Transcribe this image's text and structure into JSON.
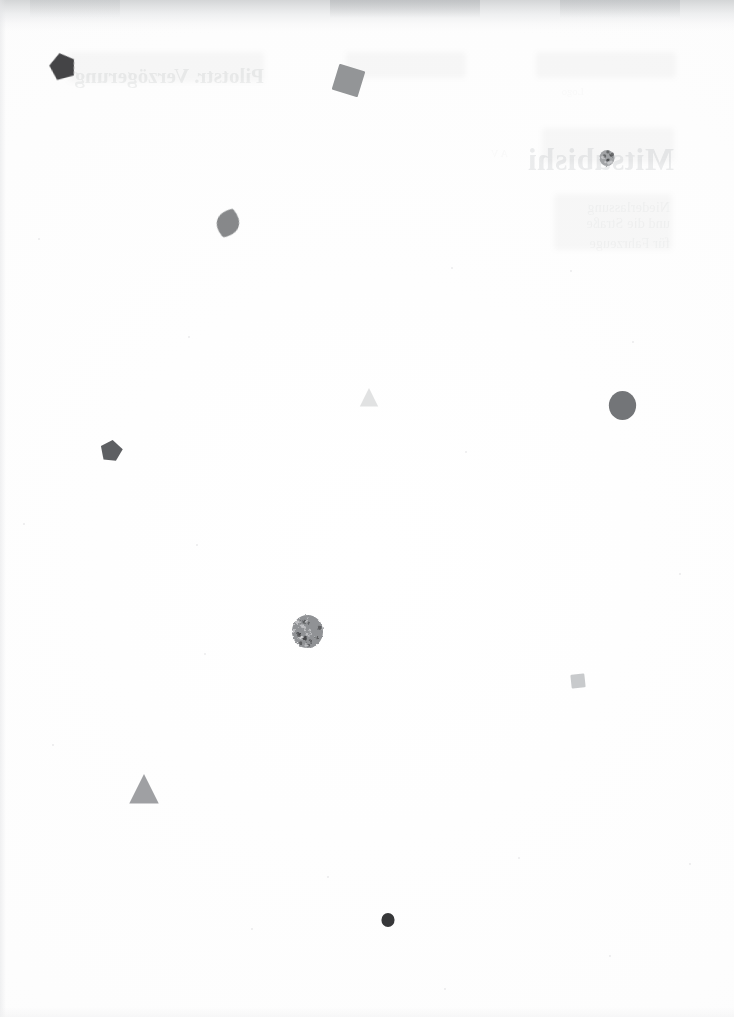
{
  "page": {
    "kind": "scanned-paper-page",
    "width_px": 734,
    "height_px": 1017,
    "paper_color": "#ffffff",
    "scanner_edge_color": "#c4c6c8",
    "caption": ""
  },
  "bleed_through": {
    "note": "Show-through text from the reverse side of the sheet; appears mirrored and extremely faint.",
    "lines": [
      {
        "id": "bt-title-right",
        "text": "Pilotstr. Verzögerung",
        "style": "subhead",
        "x": 470,
        "y": 64,
        "opacity": 0.1
      },
      {
        "id": "bt-title-left",
        "text": "Mitsubishi",
        "style": "headline",
        "x": 60,
        "y": 142,
        "opacity": 0.11
      },
      {
        "id": "bt-line-1",
        "text": "Niederlassung",
        "style": "body",
        "x": 64,
        "y": 200,
        "opacity": 0.07
      },
      {
        "id": "bt-line-2",
        "text": "und die Straße",
        "style": "body",
        "x": 64,
        "y": 216,
        "opacity": 0.07
      },
      {
        "id": "bt-line-3",
        "text": "für Fahrzeuge",
        "style": "body",
        "x": 64,
        "y": 236,
        "opacity": 0.07
      },
      {
        "id": "bt-line-4",
        "text": "A V",
        "style": "tiny",
        "x": 226,
        "y": 148,
        "opacity": 0.06
      },
      {
        "id": "bt-line-5",
        "text": "Logo",
        "style": "tiny",
        "x": 150,
        "y": 86,
        "opacity": 0.05
      }
    ],
    "blocks": [
      {
        "id": "bt-block-1",
        "x": 58,
        "y": 52,
        "w": 140,
        "h": 26
      },
      {
        "id": "bt-block-2",
        "x": 268,
        "y": 52,
        "w": 120,
        "h": 26
      },
      {
        "id": "bt-block-3",
        "x": 470,
        "y": 52,
        "w": 196,
        "h": 30
      },
      {
        "id": "bt-block-4",
        "x": 60,
        "y": 128,
        "w": 132,
        "h": 34
      },
      {
        "id": "bt-block-5",
        "x": 62,
        "y": 194,
        "w": 118,
        "h": 56
      }
    ]
  },
  "marks": [
    {
      "id": "mark-pentagon-dark",
      "shape": "pentagon",
      "label": "dark charcoal pentagon particle",
      "cx": 63,
      "cy": 67,
      "size": 28,
      "rotation": -12,
      "fill": "#3b3b3d",
      "opacity": 0.95,
      "texture": "rough"
    },
    {
      "id": "mark-square-gray-top",
      "shape": "square",
      "label": "mid-gray rotated square particle",
      "cx": 348,
      "cy": 80,
      "size": 27,
      "rotation": 17,
      "fill": "#8e9092",
      "opacity": 0.95,
      "texture": "flat"
    },
    {
      "id": "mark-circle-small-right",
      "shape": "circle",
      "label": "small mottled gray circle",
      "cx": 607,
      "cy": 158,
      "size": 16,
      "rotation": 0,
      "fill": "#9b9da0",
      "opacity": 0.92,
      "texture": "mottled"
    },
    {
      "id": "mark-lens-gray",
      "shape": "lens",
      "label": "gray lens / leaf shaped particle",
      "cx": 228,
      "cy": 223,
      "size": 30,
      "rotation": 18,
      "fill": "#7e8082",
      "opacity": 0.93,
      "texture": "rough"
    },
    {
      "id": "mark-triangle-faint",
      "shape": "triangle",
      "label": "very faint light-gray triangle",
      "cx": 369,
      "cy": 398,
      "size": 20,
      "rotation": 0,
      "fill": "#dedfe0",
      "opacity": 0.9,
      "texture": "flat"
    },
    {
      "id": "mark-circle-big-right",
      "shape": "circle",
      "label": "large solid gray circle",
      "cx": 622,
      "cy": 405,
      "size": 29,
      "rotation": 0,
      "fill": "#6e7073",
      "opacity": 0.96,
      "texture": "flat"
    },
    {
      "id": "mark-pentagon-mid",
      "shape": "pentagon",
      "label": "dark gray pentagon particle",
      "cx": 111,
      "cy": 451,
      "size": 22,
      "rotation": 8,
      "fill": "#55575a",
      "opacity": 0.95,
      "texture": "flat"
    },
    {
      "id": "mark-circle-textured",
      "shape": "circle",
      "label": "heavily textured granular circle",
      "cx": 307,
      "cy": 631,
      "size": 33,
      "rotation": 0,
      "fill": "#8b8d90",
      "opacity": 0.95,
      "texture": "granular"
    },
    {
      "id": "mark-square-faint",
      "shape": "square",
      "label": "small pale gray square",
      "cx": 578,
      "cy": 681,
      "size": 14,
      "rotation": -6,
      "fill": "#c3c5c7",
      "opacity": 0.9,
      "texture": "flat"
    },
    {
      "id": "mark-triangle-gray",
      "shape": "triangle",
      "label": "medium gray triangle",
      "cx": 144,
      "cy": 790,
      "size": 32,
      "rotation": 0,
      "fill": "#9a9c9f",
      "opacity": 0.95,
      "texture": "flat"
    },
    {
      "id": "mark-circle-dark-bottom",
      "shape": "circle",
      "label": "small dark circle",
      "cx": 388,
      "cy": 920,
      "size": 14,
      "rotation": 0,
      "fill": "#2e2f31",
      "opacity": 0.96,
      "texture": "flat"
    }
  ],
  "specks": [
    {
      "x": 39,
      "y": 239,
      "r": 1.2
    },
    {
      "x": 452,
      "y": 268,
      "r": 1.0
    },
    {
      "x": 571,
      "y": 271,
      "r": 1.0
    },
    {
      "x": 189,
      "y": 337,
      "r": 0.9
    },
    {
      "x": 633,
      "y": 342,
      "r": 0.9
    },
    {
      "x": 466,
      "y": 452,
      "r": 1.0
    },
    {
      "x": 24,
      "y": 524,
      "r": 0.9
    },
    {
      "x": 197,
      "y": 545,
      "r": 0.9
    },
    {
      "x": 680,
      "y": 574,
      "r": 0.9
    },
    {
      "x": 205,
      "y": 654,
      "r": 1.0
    },
    {
      "x": 53,
      "y": 745,
      "r": 0.9
    },
    {
      "x": 519,
      "y": 858,
      "r": 1.1
    },
    {
      "x": 328,
      "y": 877,
      "r": 0.9
    },
    {
      "x": 690,
      "y": 864,
      "r": 0.9
    },
    {
      "x": 252,
      "y": 929,
      "r": 0.9
    },
    {
      "x": 610,
      "y": 956,
      "r": 0.9
    },
    {
      "x": 445,
      "y": 989,
      "r": 0.9
    }
  ]
}
